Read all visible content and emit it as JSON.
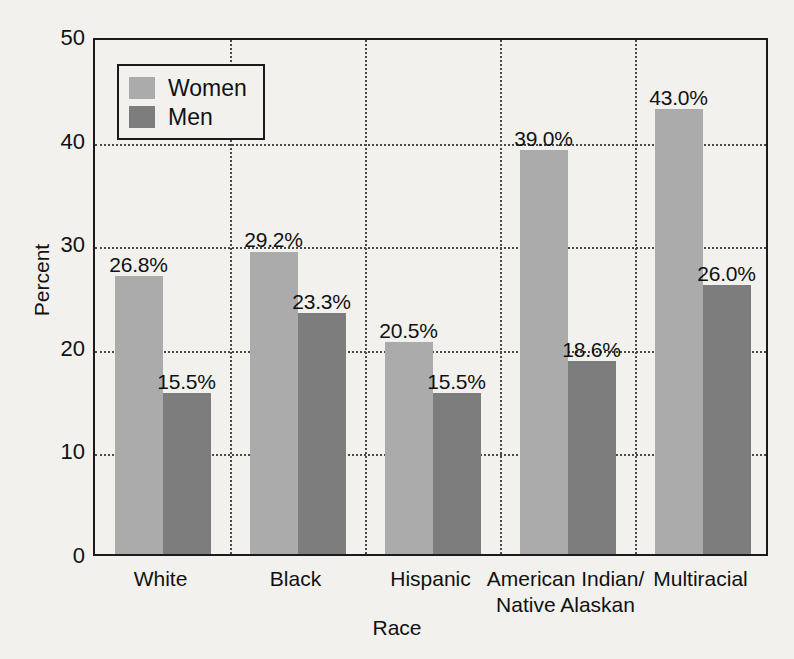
{
  "chart_data": {
    "type": "bar",
    "title": "",
    "xlabel": "Race",
    "ylabel": "Percent",
    "ylim": [
      0,
      50
    ],
    "ytick_values": [
      0,
      10,
      20,
      30,
      40,
      50
    ],
    "ytick_labels": [
      "0",
      "10",
      "20",
      "30",
      "40",
      "50"
    ],
    "grid": "horizontal dotted at 10,20,30,40; vertical dotted separators between category groups",
    "legend_position": "top-left inside axes, boxed",
    "categories": [
      "White",
      "Black",
      "Hispanic",
      "American Indian/\nNative Alaskan",
      "Multiracial"
    ],
    "category_lines": [
      [
        "White"
      ],
      [
        "Black"
      ],
      [
        "Hispanic"
      ],
      [
        "American Indian/",
        "Native Alaskan"
      ],
      [
        "Multiracial"
      ]
    ],
    "series": [
      {
        "name": "Women",
        "color": "#ababab",
        "values": [
          26.8,
          29.2,
          20.5,
          39.0,
          43.0
        ],
        "data_labels": [
          "26.8%",
          "29.2%",
          "20.5%",
          "39.0%",
          "43.0%"
        ]
      },
      {
        "name": "Men",
        "color": "#7d7d7d",
        "values": [
          15.5,
          23.3,
          15.5,
          18.6,
          26.0
        ],
        "data_labels": [
          "15.5%",
          "23.3%",
          "15.5%",
          "18.6%",
          "26.0%"
        ]
      }
    ]
  },
  "legend": {
    "entries": [
      {
        "label": "Women",
        "color": "#ababab"
      },
      {
        "label": "Men",
        "color": "#7d7d7d"
      }
    ]
  },
  "axes": {
    "y_title": "Percent",
    "x_title": "Race"
  },
  "colors": {
    "background": "#f2f1ee",
    "axis": "#1b1b1b",
    "grid": "#4a4a4a",
    "text": "#111111",
    "women": "#ababab",
    "men": "#7d7d7d"
  }
}
